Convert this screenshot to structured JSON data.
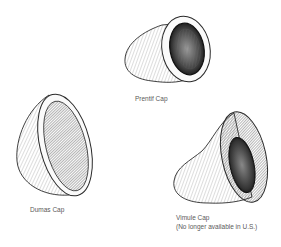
{
  "figure": {
    "items": [
      {
        "id": "prentif",
        "label": "Prentif Cap",
        "note": ""
      },
      {
        "id": "dumas",
        "label": "Dumas Cap",
        "note": ""
      },
      {
        "id": "vimule",
        "label": "Vimule Cap",
        "note": "(No longer available in U.S.)"
      }
    ]
  },
  "colors": {
    "background": "#ffffff",
    "line": "#2a2a2a",
    "label": "#5a5a5a"
  }
}
